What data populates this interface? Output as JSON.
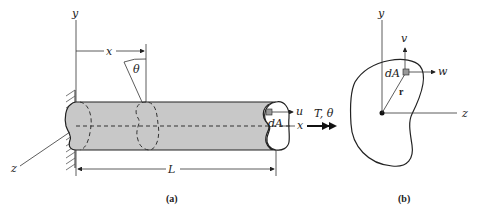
{
  "figure": {
    "panel_a": {
      "caption": "(a)",
      "labels": {
        "y_axis": "y",
        "x_distance": "x",
        "angle": "θ",
        "z_axis": "z",
        "element_area": "dA",
        "displacement_u": "u",
        "x_axis": "x",
        "torque": "T, θ",
        "length": "L"
      }
    },
    "panel_b": {
      "caption": "(b)",
      "labels": {
        "y_axis": "y",
        "displacement_v": "v",
        "element_area": "dA",
        "displacement_w": "w",
        "radius": "r",
        "z_axis": "z"
      }
    },
    "colors": {
      "bar_fill": "#c8c8c8",
      "stroke": "#222222",
      "background": "#ffffff"
    }
  }
}
